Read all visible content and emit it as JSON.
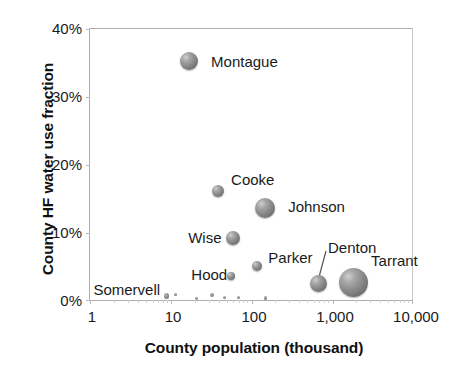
{
  "chart_data": {
    "type": "scatter",
    "title": "",
    "xlabel": "County population (thousand)",
    "ylabel": "County HF water use fraction",
    "xscale": "log",
    "xlim": [
      1,
      10000
    ],
    "ylim": [
      0,
      0.4
    ],
    "grid": false,
    "legend": "none",
    "xticks": [
      "1",
      "10",
      "100",
      "1,000",
      "10,000"
    ],
    "yticks": [
      "0%",
      "10%",
      "20%",
      "30%",
      "40%"
    ],
    "bubble_size_encodes": "county HF water use volume",
    "points": [
      {
        "label": "Montague",
        "x": 17,
        "y": 0.353,
        "size": 9.0,
        "label_dx": 13,
        "label_dy": -8
      },
      {
        "label": "Cooke",
        "x": 39,
        "y": 0.161,
        "size": 6.0,
        "label_dx": 7,
        "label_dy": -20
      },
      {
        "label": "Johnson",
        "x": 150,
        "y": 0.136,
        "size": 10.0,
        "label_dx": 13,
        "label_dy": -10
      },
      {
        "label": "Wise",
        "x": 60,
        "y": 0.092,
        "size": 7.0,
        "label_dx": -52,
        "label_dy": -9
      },
      {
        "label": "Parker",
        "x": 120,
        "y": 0.05,
        "size": 5.0,
        "label_dx": 6,
        "label_dy": -17
      },
      {
        "label": "Hood",
        "x": 57,
        "y": 0.035,
        "size": 4.0,
        "label_dx": -44,
        "label_dy": -10
      },
      {
        "label": "Denton",
        "x": 690,
        "y": 0.025,
        "size": 8.5,
        "label_dx": 1,
        "label_dy": -44
      },
      {
        "label": "Tarrant",
        "x": 1880,
        "y": 0.026,
        "size": 14.5,
        "label_dx": 3,
        "label_dy": -30
      },
      {
        "label": "Somervell",
        "x": 9,
        "y": 0.006,
        "size": 2.6,
        "label_dx": -76,
        "label_dy": -15
      },
      {
        "label": "",
        "x": 11.5,
        "y": 0.008,
        "size": 1.6,
        "label_dx": 0,
        "label_dy": 0
      },
      {
        "label": "",
        "x": 21,
        "y": 0.002,
        "size": 1.4,
        "label_dx": 0,
        "label_dy": 0
      },
      {
        "label": "",
        "x": 33,
        "y": 0.007,
        "size": 2.0,
        "label_dx": 0,
        "label_dy": 0
      },
      {
        "label": "",
        "x": 47,
        "y": 0.003,
        "size": 1.5,
        "label_dx": 0,
        "label_dy": 0
      },
      {
        "label": "",
        "x": 70,
        "y": 0.004,
        "size": 1.5,
        "label_dx": 0,
        "label_dy": 0
      },
      {
        "label": "",
        "x": 150,
        "y": 0.003,
        "size": 1.6,
        "label_dx": 0,
        "label_dy": 0
      }
    ],
    "annotations": [
      {
        "name": "denton-leader-line",
        "from": "Denton-label",
        "to": "Denton-bubble"
      }
    ]
  },
  "colors": {
    "bubble_fill": "#8e8e8e",
    "bubble_highlight": "#cfcfcf",
    "bubble_shadow": "#4f4f4f",
    "axis_line": "#aeaeae",
    "text": "#1a1a1a",
    "background": "#ffffff"
  }
}
